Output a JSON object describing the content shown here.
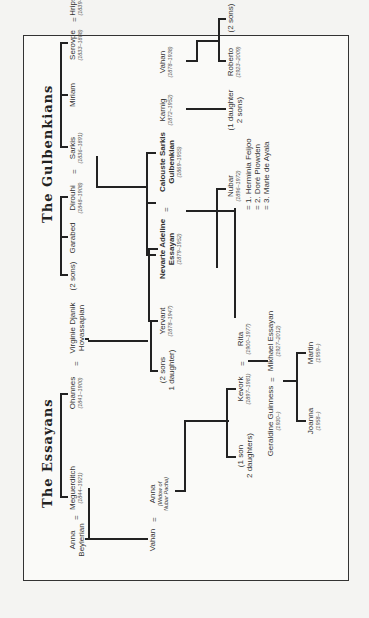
{
  "diagram": {
    "type": "family-tree",
    "orientation": "rotated-90-ccw",
    "sections": [
      {
        "title": "The Essayans"
      },
      {
        "title": "The Gulbenkians"
      }
    ]
  },
  "essayans": {
    "title": "The Essayans",
    "anna_b": {
      "name": "Anna\nBeylerian"
    },
    "meguerditch": {
      "name": "Meguerditch",
      "dates": "(1844–1921)"
    },
    "ohannes": {
      "name": "Ohannes",
      "dates": "(1841–1900)"
    },
    "virginie": {
      "name": "Virginie Djanik\nHovassapian"
    },
    "vahan_e": {
      "name": "Vahan"
    },
    "anna_w": {
      "name": "Anna",
      "note": "(Widow of\nNubar Pacha)"
    },
    "two_sons": {
      "name": "(2 sons\n1 daughter)"
    },
    "yervant": {
      "name": "Yervant",
      "dates": "(1878–1947)"
    },
    "nevarte": {
      "name": "Nevarte Adeline\nEssayan",
      "dates": "(1879–1952)"
    },
    "one_son": {
      "name": "(1 son\n2 daughters)"
    },
    "kevork": {
      "name": "Kevork",
      "dates": "(1897–1981)"
    },
    "rita": {
      "name": "Rita",
      "dates": "(1900–1977)"
    },
    "geraldine": {
      "name": "Geraldine Guinness",
      "dates": "(1930–)"
    },
    "mikhael": {
      "name": "Mikhael Essayan",
      "dates": "(1927–2012)"
    },
    "joanna": {
      "name": "Joanna",
      "dates": "(1958–)"
    },
    "martin": {
      "name": "Martin",
      "dates": "(1959–)"
    }
  },
  "gulbenkians": {
    "title": "The Gulbenkians",
    "two_sons_g": {
      "name": "(2 sons)"
    },
    "garabed": {
      "name": "Garabed"
    },
    "dirouhi": {
      "name": "Dirouhi",
      "dates": "(1848–1908)"
    },
    "sarkis": {
      "name": "Sarkis",
      "dates": "(1836–1891)"
    },
    "miriam": {
      "name": "Miriam"
    },
    "serovpe": {
      "name": "Serovpe",
      "dates": "(1833–1888)"
    },
    "hripsime": {
      "name": "Hripsimé",
      "dates": "(1839–1888)"
    },
    "calouste": {
      "name": "Calouste Sarkis\nGulbenkian",
      "dates": "(1869–1955)"
    },
    "karnig": {
      "name": "Karnig",
      "dates": "(1872–1952)"
    },
    "vahan_g": {
      "name": "Vahan",
      "dates": "(1878–1938)"
    },
    "badrig": {
      "name": "Badrig",
      "dates": "(1858–1930)"
    },
    "gullabi": {
      "name": "Gullabi",
      "dates": "(1865–1918)"
    },
    "nerses": {
      "name": "Nerses",
      "dates": "(1885–1957)"
    },
    "three_sons": {
      "name": "(3 sons\n2 daughters)"
    },
    "nubar": {
      "name": "Nubar",
      "dates": "(1896–1972)",
      "spouses": [
        "= 1. Herminia Feijoo",
        "= 2. Doré Plowden",
        "= 3. Marie de Ayala"
      ]
    },
    "one_daughter": {
      "name": "(1 daughter\n2 sons)"
    },
    "roberto": {
      "name": "Roberto",
      "dates": "(1923–2009)"
    },
    "two_sons_r": {
      "name": "(2 sons)"
    }
  },
  "marriage_symbol": "="
}
